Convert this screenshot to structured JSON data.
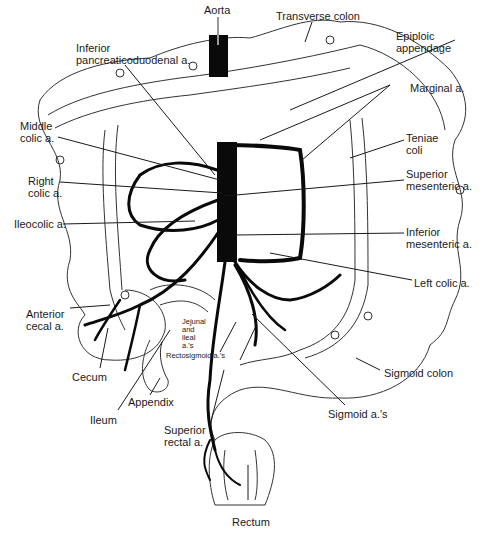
{
  "figure": {
    "colors": {
      "artery": "#0a0a0a",
      "outline": "#333333",
      "leader": "#1a1a1a",
      "background": "#ffffff"
    }
  },
  "labels": {
    "aorta": "Aorta",
    "transverse_colon": "Transverse colon",
    "epiploic_appendage": "Epiploic\nappendage",
    "inferior_pancreaticoduodenal": "Inferior\npancreaticoduodenal a.",
    "marginal": "Marginal a.",
    "middle_colic": "Middle\ncolic a.",
    "teniae_coli": "Teniae\ncoli",
    "right_colic": "Right\ncolic a.",
    "superior_mesenteric": "Superior\nmesenteric a.",
    "ileocolic": "Ileocolic a.",
    "inferior_mesenteric": "Inferior\nmesenteric a.",
    "left_colic": "Left colic a.",
    "anterior_cecal": "Anterior\ncecal a.",
    "jejunal_ileal": "Jejunal\nand\nileal\na.'s",
    "rectosigmoid": "Rectosigmoid a.'s",
    "cecum": "Cecum",
    "sigmoid_colon": "Sigmoid colon",
    "appendix": "Appendix",
    "ileum": "Ileum",
    "superior_rectal": "Superior\nrectal a.",
    "sigmoid_arteries": "Sigmoid a.'s",
    "rectum": "Rectum"
  }
}
